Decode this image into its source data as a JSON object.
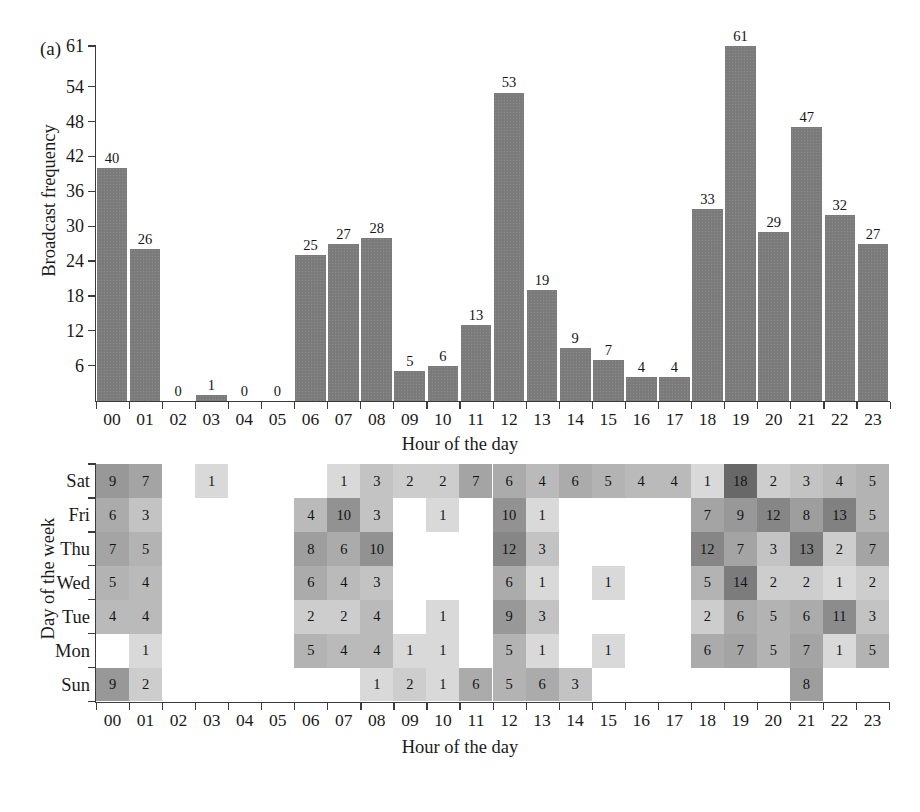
{
  "figure": {
    "panel_a_tag": "(a)",
    "panel_b_tag": "(b)"
  },
  "chart_data": [
    {
      "type": "bar",
      "panel": "(a)",
      "title": "",
      "xlabel": "Hour of the day",
      "ylabel": "Broadcast frequency",
      "categories": [
        "00",
        "01",
        "02",
        "03",
        "04",
        "05",
        "06",
        "07",
        "08",
        "09",
        "10",
        "11",
        "12",
        "13",
        "14",
        "15",
        "16",
        "17",
        "18",
        "19",
        "20",
        "21",
        "22",
        "23"
      ],
      "values": [
        40,
        26,
        0,
        1,
        0,
        0,
        25,
        27,
        28,
        5,
        6,
        13,
        53,
        19,
        9,
        7,
        4,
        4,
        33,
        61,
        29,
        47,
        32,
        27
      ],
      "value_labels": [
        "40",
        "26",
        "0",
        "1",
        "0",
        "0",
        "25",
        "27",
        "28",
        "5",
        "6",
        "13",
        "53",
        "19",
        "9",
        "7",
        "4",
        "4",
        "33",
        "61",
        "29",
        "47",
        "32",
        "27"
      ],
      "yticks": [
        6,
        12,
        18,
        24,
        30,
        36,
        42,
        48,
        54,
        61
      ],
      "ytick_labels": [
        "6",
        "12",
        "18",
        "24",
        "30",
        "36",
        "42",
        "48",
        "54",
        "61"
      ],
      "ylim": [
        0,
        61
      ],
      "grid": false,
      "legend": "none",
      "bar_color": "#7b7b7b"
    },
    {
      "type": "heatmap",
      "panel": "(b)",
      "title": "",
      "xlabel": "Hour of the day",
      "ylabel": "Day of the week",
      "x_categories": [
        "00",
        "01",
        "02",
        "03",
        "04",
        "05",
        "06",
        "07",
        "08",
        "09",
        "10",
        "11",
        "12",
        "13",
        "14",
        "15",
        "16",
        "17",
        "18",
        "19",
        "20",
        "21",
        "22",
        "23"
      ],
      "y_categories": [
        "Sat",
        "Fri",
        "Thu",
        "Wed",
        "Tue",
        "Mon",
        "Sun"
      ],
      "vmin": 0,
      "vmax": 18,
      "cell_color_low": "#f0f0f0",
      "cell_color_high": "#6e6e6e",
      "rows": [
        {
          "day": "Sat",
          "values": [
            9,
            7,
            null,
            1,
            null,
            null,
            null,
            1,
            3,
            2,
            2,
            7,
            6,
            4,
            6,
            5,
            4,
            4,
            1,
            18,
            2,
            3,
            4,
            5
          ]
        },
        {
          "day": "Fri",
          "values": [
            6,
            3,
            null,
            null,
            null,
            null,
            4,
            10,
            3,
            null,
            1,
            null,
            10,
            1,
            null,
            null,
            null,
            null,
            7,
            9,
            12,
            8,
            13,
            5
          ]
        },
        {
          "day": "Thu",
          "values": [
            7,
            5,
            null,
            null,
            null,
            null,
            8,
            6,
            10,
            null,
            null,
            null,
            12,
            3,
            null,
            null,
            null,
            null,
            12,
            7,
            3,
            13,
            2,
            7
          ]
        },
        {
          "day": "Wed",
          "values": [
            5,
            4,
            null,
            null,
            null,
            null,
            6,
            4,
            3,
            null,
            null,
            null,
            6,
            1,
            null,
            1,
            null,
            null,
            5,
            14,
            2,
            2,
            1,
            2
          ]
        },
        {
          "day": "Tue",
          "values": [
            4,
            4,
            null,
            null,
            null,
            null,
            2,
            2,
            4,
            null,
            1,
            null,
            9,
            3,
            null,
            null,
            null,
            null,
            2,
            6,
            5,
            6,
            11,
            3
          ]
        },
        {
          "day": "Mon",
          "values": [
            null,
            1,
            null,
            null,
            null,
            null,
            5,
            4,
            4,
            1,
            1,
            null,
            5,
            1,
            null,
            1,
            null,
            null,
            6,
            7,
            5,
            7,
            1,
            5
          ]
        },
        {
          "day": "Sun",
          "values": [
            9,
            2,
            null,
            null,
            null,
            null,
            null,
            null,
            1,
            2,
            1,
            6,
            5,
            6,
            3,
            null,
            null,
            null,
            null,
            null,
            null,
            8,
            null,
            null
          ]
        }
      ]
    }
  ]
}
